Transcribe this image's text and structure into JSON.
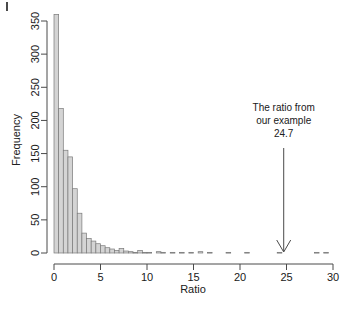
{
  "figure": {
    "corner_mark": "page-edge-mark",
    "background_color": "#ffffff",
    "bar_fill_color": "#d4d4d4",
    "bar_stroke_color": "#7a7a7a",
    "axis_color": "#4a4a4a",
    "annotation_color": "#202020"
  },
  "chart_data": {
    "type": "bar",
    "subtype": "histogram",
    "title": "",
    "xlabel": "Ratio",
    "ylabel": "Frequency",
    "xlim": [
      0,
      30
    ],
    "ylim": [
      0,
      360
    ],
    "xticks": [
      0,
      5,
      10,
      15,
      20,
      25,
      30
    ],
    "xtick_labels": [
      "0",
      "5",
      "10",
      "15",
      "20",
      "25",
      "30"
    ],
    "yticks": [
      0,
      50,
      100,
      150,
      200,
      250,
      300,
      350
    ],
    "ytick_labels": [
      "0",
      "50",
      "100",
      "150",
      "200",
      "250",
      "300",
      "350"
    ],
    "grid": false,
    "legend": null,
    "bin_width": 0.5,
    "bin_starts": [
      0.0,
      0.5,
      1.0,
      1.5,
      2.0,
      2.5,
      3.0,
      3.5,
      4.0,
      4.5,
      5.0,
      5.5,
      6.0,
      6.5,
      7.0,
      7.5,
      8.0,
      8.5,
      9.0,
      9.5,
      10.0,
      10.5,
      11.0,
      11.5,
      12.0,
      12.5,
      13.0,
      13.5,
      14.0,
      14.5,
      15.0,
      15.5,
      16.0,
      16.5,
      17.0,
      17.5,
      18.0,
      18.5,
      19.0,
      19.5,
      20.0,
      20.5,
      21.0,
      21.5,
      22.0,
      22.5,
      23.0,
      23.5,
      24.0,
      24.5,
      25.0,
      25.5,
      26.0,
      26.5,
      27.0,
      27.5,
      28.0,
      28.5,
      29.0,
      29.5
    ],
    "values": [
      360,
      218,
      155,
      145,
      97,
      60,
      30,
      22,
      18,
      14,
      11,
      8,
      6,
      4,
      7,
      3,
      2,
      1,
      4,
      1,
      1,
      0,
      2,
      1,
      0,
      1,
      0,
      1,
      0,
      1,
      0,
      2,
      0,
      1,
      0,
      0,
      0,
      1,
      0,
      0,
      0,
      1,
      0,
      0,
      0,
      0,
      0,
      0,
      1,
      0,
      0,
      0,
      0,
      0,
      0,
      0,
      1,
      0,
      1,
      0
    ],
    "annotations": [
      {
        "name": "example-ratio-callout",
        "lines": [
          "The ratio from",
          "our example",
          "24.7"
        ],
        "value": 24.7,
        "arrow": "down-arrow-to-axis"
      }
    ]
  }
}
